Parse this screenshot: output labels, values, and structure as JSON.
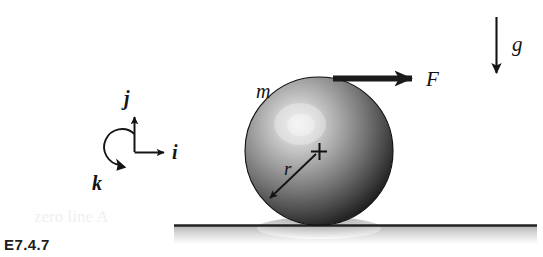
{
  "figure": {
    "id_label": "E7.4.7",
    "background_color": "#ffffff",
    "ink_color": "#141414"
  },
  "ghost": {
    "text": "zero line A"
  },
  "axes": {
    "name": "coordinate-triad",
    "origin": {
      "x": 134,
      "y": 152
    },
    "vectors": [
      {
        "key": "j",
        "label": "j",
        "direction": "up",
        "label_x": 130,
        "label_y": 103
      },
      {
        "key": "i",
        "label": "i",
        "direction": "right",
        "label_x": 178,
        "label_y": 157
      },
      {
        "key": "k",
        "label": "k",
        "direction": "out-of-plane-ccw-arc",
        "label_x": 96,
        "label_y": 187
      }
    ]
  },
  "body": {
    "name": "sphere",
    "mass_label": "m",
    "mass_label_x": 256,
    "mass_label_y": 98,
    "center": {
      "x": 319,
      "y": 151
    },
    "radius": 74,
    "center_mark": "+",
    "radius_label": "r",
    "radius_label_x": 288,
    "radius_label_y": 172,
    "highlight": {
      "x": 300,
      "y": 124
    },
    "shade_dark": "#151515",
    "shade_mid": "#6e6e6e",
    "shade_light": "#d9d9d9"
  },
  "force": {
    "name": "applied-force-arrow",
    "label": "F",
    "label_x": 432,
    "label_y": 85,
    "start_x": 333,
    "end_x": 417,
    "y": 78,
    "thickness": 6
  },
  "gravity": {
    "name": "gravity-arrow",
    "label": "g",
    "label_x": 519,
    "label_y": 50,
    "x": 496,
    "start_y": 17,
    "end_y": 77,
    "thickness": 2
  },
  "ground": {
    "name": "ground-surface",
    "y": 225,
    "start_x": 174,
    "end_x": 537,
    "line_color": "#232323",
    "shadow_color": "#c9c9c9"
  }
}
